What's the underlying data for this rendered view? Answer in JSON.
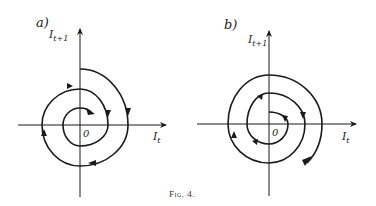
{
  "figure": {
    "caption": "Fig. 4.",
    "panels": [
      {
        "id": "a",
        "label": "a)",
        "y_axis_label": "I",
        "y_axis_sub": "t+1",
        "x_axis_label": "I",
        "x_axis_sub": "t",
        "origin_label": "0",
        "description": "Converging (inward) clockwise spiral"
      },
      {
        "id": "b",
        "label": "b)",
        "y_axis_label": "I",
        "y_axis_sub": "t+1",
        "x_axis_label": "I",
        "x_axis_sub": "t",
        "origin_label": "0",
        "description": "Diverging (outward) clockwise spiral"
      }
    ]
  },
  "colors": {
    "stroke": "#1a1a1a",
    "background": "#ffffff"
  }
}
